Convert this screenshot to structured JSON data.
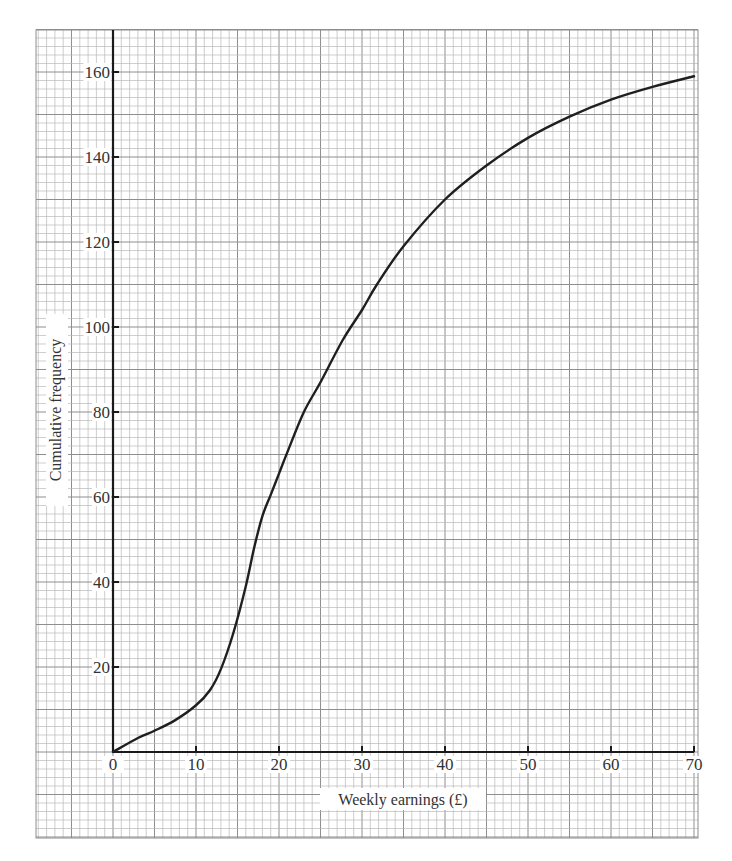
{
  "chart_data": {
    "type": "line",
    "title": "",
    "xlabel": "Weekly earnings (£)",
    "ylabel": "Cumulative frequency",
    "xlim": [
      0,
      70
    ],
    "ylim": [
      0,
      160
    ],
    "x_ticks": [
      0,
      10,
      20,
      30,
      40,
      50,
      60,
      70
    ],
    "y_ticks": [
      20,
      40,
      60,
      80,
      100,
      120,
      140,
      160
    ],
    "grid": true,
    "legend": null,
    "series": [
      {
        "name": "Cumulative frequency curve (ogive)",
        "x": [
          0,
          3,
          5,
          7.5,
          10,
          11.7,
          13,
          14.5,
          16,
          17,
          18,
          19,
          20,
          21,
          23,
          25,
          27.7,
          30,
          31.8,
          35,
          40,
          45,
          50,
          55,
          60,
          65,
          70
        ],
        "y": [
          0,
          3.3,
          5,
          7.5,
          11,
          14.6,
          19.5,
          28,
          39,
          48,
          55.5,
          60.5,
          65.5,
          70.5,
          80,
          87,
          97,
          104,
          110,
          119,
          130,
          138,
          144.5,
          149.5,
          153.5,
          156.5,
          159
        ]
      }
    ]
  },
  "colors": {
    "curve": "#1f1f1f",
    "axis": "#1a1a1a",
    "minor_grid": "#b9b9b9",
    "major_grid": "#8e8e8e",
    "text": "#333333",
    "background": "#ffffff"
  }
}
